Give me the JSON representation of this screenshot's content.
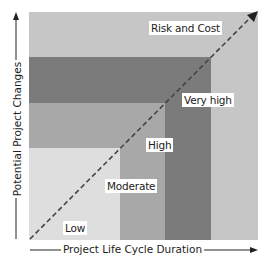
{
  "diagram": {
    "title": "Risk and Cost",
    "x_axis_label": "Project Life Cycle Duration",
    "y_axis_label": "Potential Project Changes",
    "levels": [
      {
        "label": "Low",
        "color": "#dedede"
      },
      {
        "label": "Moderate",
        "color": "#a8a8a8"
      },
      {
        "label": "High",
        "color": "#a8a8a8"
      },
      {
        "label": "Very high",
        "color": "#7b7b7b"
      }
    ],
    "background_color": "#c6c6c6",
    "diagonal": "Risk and Cost trend (dashed arrow)"
  }
}
